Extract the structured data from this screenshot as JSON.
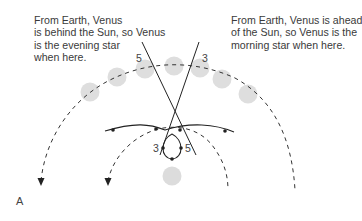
{
  "captions": {
    "left": "From Earth, Venus\nis behind the Sun, so Venus\nis the evening star\nwhen here.",
    "right": "From Earth, Venus is ahead\nof the Sun, so Venus is the\nmorning star when here."
  },
  "labels": {
    "top_left_number": "5",
    "top_right_number": "3",
    "loop_left_number": "3",
    "loop_right_number": "5",
    "panel": "A"
  },
  "colors": {
    "venus_circle": "#dedede",
    "earth_circle": "#dcdcdc",
    "line": "#222222",
    "dashed": "#333333"
  }
}
